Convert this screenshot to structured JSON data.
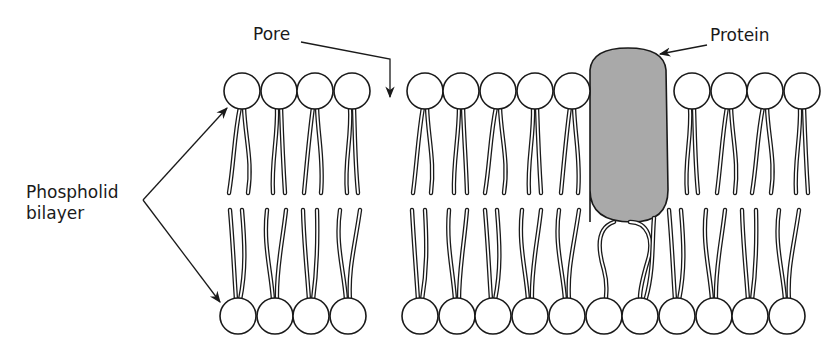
{
  "diagram": {
    "labels": {
      "pore": "Pore",
      "protein": "Protein",
      "phospholipid_line1": "Phospholid",
      "phospholipid_line2": "bilayer"
    },
    "colors": {
      "stroke": "#1a1a1a",
      "head_fill": "#ffffff",
      "protein_fill": "#a9a9a9",
      "tail_fill": "#ffffff",
      "background": "#ffffff"
    },
    "head_radius": 18,
    "top_row": {
      "y": 91,
      "left_group_x": [
        242,
        279,
        315,
        352
      ],
      "right_group_x": [
        425,
        461,
        498,
        535,
        572,
        692,
        729,
        765,
        802
      ]
    },
    "bottom_row": {
      "y": 316,
      "left_group_x": [
        238,
        275,
        311,
        348
      ],
      "right_group_x": [
        420,
        457,
        493,
        530,
        567,
        604,
        640,
        677,
        714,
        750,
        787
      ]
    },
    "protein": {
      "x": 588,
      "y": 48,
      "width": 80,
      "height": 174
    }
  }
}
